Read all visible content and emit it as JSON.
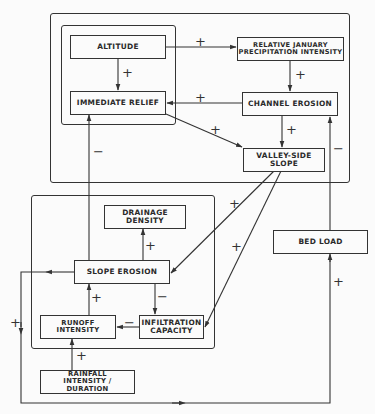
{
  "diagram": {
    "type": "causal-loop",
    "frames": [
      {
        "id": "upper-system",
        "x": 50,
        "y": 13,
        "w": 300,
        "h": 170
      },
      {
        "id": "relief-subsystem",
        "x": 61,
        "y": 25,
        "w": 115,
        "h": 100
      },
      {
        "id": "slope-subsystem",
        "x": 31,
        "y": 195,
        "w": 184,
        "h": 154
      }
    ],
    "nodes": [
      {
        "id": "altitude",
        "label": "ALTITUDE"
      },
      {
        "id": "precip",
        "label": "RELATIVE  JANUARY\nPRECIPITATION  INTENSITY"
      },
      {
        "id": "relief",
        "label": "IMMEDIATE   RELIEF"
      },
      {
        "id": "channel",
        "label": "CHANNEL  EROSION"
      },
      {
        "id": "valley",
        "label": "VALLEY-SIDE SLOPE"
      },
      {
        "id": "drainage",
        "label": "DRAINAGE  DENSITY"
      },
      {
        "id": "slope",
        "label": "SLOPE  EROSION"
      },
      {
        "id": "runoff",
        "label": "RUNOFF INTENSITY"
      },
      {
        "id": "infiltration",
        "label": "INFILTRATION\nCAPACITY"
      },
      {
        "id": "rainfall",
        "label": "RAINFALL\nINTENSITY / DURATION"
      },
      {
        "id": "bedload",
        "label": "BED  LOAD"
      }
    ],
    "edges": [
      {
        "from": "altitude",
        "to": "precip",
        "sign": "+"
      },
      {
        "from": "altitude",
        "to": "relief",
        "sign": "+"
      },
      {
        "from": "precip",
        "to": "channel",
        "sign": "+"
      },
      {
        "from": "channel",
        "to": "relief",
        "sign": "+"
      },
      {
        "from": "relief",
        "to": "valley",
        "sign": "+"
      },
      {
        "from": "channel",
        "to": "valley",
        "sign": "+"
      },
      {
        "from": "slope",
        "to": "relief",
        "sign": "−"
      },
      {
        "from": "bedload",
        "to": "channel",
        "sign": "−"
      },
      {
        "from": "valley",
        "to": "slope",
        "sign": "+"
      },
      {
        "from": "valley",
        "to": "infiltration",
        "sign": "+"
      },
      {
        "from": "slope",
        "to": "drainage",
        "sign": "+"
      },
      {
        "from": "slope",
        "to": "infiltration",
        "sign": "−"
      },
      {
        "from": "infiltration",
        "to": "runoff",
        "sign": "−"
      },
      {
        "from": "runoff",
        "to": "slope",
        "sign": "+"
      },
      {
        "from": "rainfall",
        "to": "runoff",
        "sign": "+"
      },
      {
        "from": "slope",
        "to": "bedload",
        "sign": "+"
      },
      {
        "from": "slope",
        "to": "bedload",
        "sign": "+",
        "segment": "return-right"
      }
    ],
    "signs": {
      "altitude_precip": "+",
      "altitude_relief": "+",
      "precip_channel": "+",
      "channel_relief": "+",
      "relief_valley": "+",
      "channel_valley": "+",
      "slope_relief": "−",
      "bedload_channel": "−",
      "valley_slope": "+",
      "valley_infiltration": "+",
      "slope_drainage": "+",
      "slope_infiltration": "−",
      "infiltration_runoff": "−",
      "runoff_slope": "+",
      "rainfall_runoff": "+",
      "slope_loop_left": "+",
      "loop_bedload": "+"
    }
  }
}
